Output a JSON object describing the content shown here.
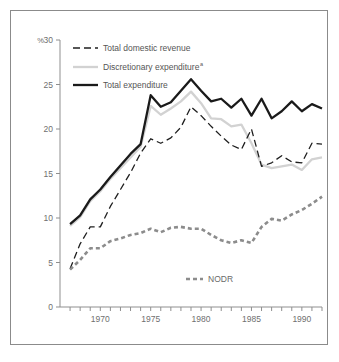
{
  "chart_data": {
    "type": "line",
    "title": "",
    "subtitle": "",
    "xlabel": "",
    "ylabel": "%",
    "ylim": [
      0,
      30
    ],
    "xlim": [
      1966,
      1992
    ],
    "yticks": [
      0,
      5,
      10,
      15,
      20,
      25,
      30
    ],
    "ytick_labels": [
      "0",
      "5",
      "10",
      "15",
      "20",
      "25",
      "30"
    ],
    "xticks": [
      1967,
      1968,
      1969,
      1970,
      1971,
      1972,
      1973,
      1974,
      1975,
      1976,
      1977,
      1978,
      1979,
      1980,
      1981,
      1982,
      1983,
      1984,
      1985,
      1986,
      1987,
      1988,
      1989,
      1990,
      1991,
      1992
    ],
    "xtick_labels": [
      "1970",
      "1975",
      "1980",
      "1985",
      "1990"
    ],
    "labeled_xticks": [
      1970,
      1975,
      1980,
      1985,
      1990
    ],
    "grid": false,
    "legend_position": "top-left",
    "x": [
      1967,
      1968,
      1969,
      1970,
      1971,
      1972,
      1973,
      1974,
      1975,
      1976,
      1977,
      1978,
      1979,
      1980,
      1981,
      1982,
      1983,
      1984,
      1985,
      1986,
      1987,
      1988,
      1989,
      1990,
      1991,
      1992
    ],
    "series": [
      {
        "name": "Total expenditure",
        "style": "solid-thick-black",
        "color": "#1a1a1a",
        "values": [
          9.3,
          10.3,
          12.1,
          13.2,
          14.6,
          15.9,
          17.2,
          18.3,
          23.8,
          22.5,
          23.0,
          24.3,
          25.6,
          24.3,
          23.1,
          23.4,
          22.4,
          23.4,
          21.5,
          23.4,
          21.2,
          22.0,
          23.1,
          22.0,
          22.8,
          22.3
        ]
      },
      {
        "name": "Discretionary expenditure",
        "style": "solid-light-gray",
        "color": "#d2d2d2",
        "superscript": "a",
        "values": [
          9.1,
          10.1,
          11.9,
          13.0,
          14.4,
          15.6,
          16.8,
          18.0,
          22.6,
          21.6,
          22.3,
          23.1,
          24.2,
          22.9,
          21.2,
          21.1,
          20.3,
          20.5,
          18.4,
          16.0,
          15.6,
          15.8,
          16.0,
          15.4,
          16.6,
          16.8
        ]
      },
      {
        "name": "Total domestic revenue",
        "style": "dashed-black",
        "color": "#1f1f1f",
        "values": [
          4.3,
          7.1,
          9.0,
          9.0,
          11.3,
          13.2,
          15.1,
          17.3,
          18.9,
          18.4,
          19.0,
          20.2,
          22.5,
          21.5,
          20.3,
          19.2,
          18.2,
          17.7,
          20.0,
          15.8,
          16.2,
          17.0,
          16.3,
          16.2,
          18.4,
          18.3
        ]
      },
      {
        "name": "NODR",
        "style": "dotted-thick-gray",
        "color": "#8c8c8c",
        "values": [
          4.2,
          5.3,
          6.6,
          6.6,
          7.4,
          7.7,
          8.1,
          8.3,
          8.8,
          8.4,
          8.9,
          9.0,
          8.8,
          8.8,
          8.1,
          7.5,
          7.2,
          7.5,
          7.2,
          9.0,
          9.9,
          9.7,
          10.4,
          10.9,
          11.6,
          12.4
        ]
      }
    ]
  },
  "axis": {
    "y_unit": "%",
    "y_tick_top": "30"
  },
  "legend": {
    "items": [
      {
        "label": "Total domestic revenue",
        "superscript": ""
      },
      {
        "label": "Discretionary expenditure",
        "superscript": "a"
      },
      {
        "label": "Total expenditure",
        "superscript": ""
      }
    ]
  },
  "inline_labels": {
    "nodr": "NODR"
  },
  "colors": {
    "total_expenditure": "#1a1a1a",
    "discretionary_expenditure": "#d2d2d2",
    "total_domestic_revenue": "#1f1f1f",
    "nodr": "#8c8c8c",
    "axis": "#8f8f8f",
    "frame": "#8b8b8b",
    "text": "#6f6f6f",
    "background": "#ffffff"
  }
}
